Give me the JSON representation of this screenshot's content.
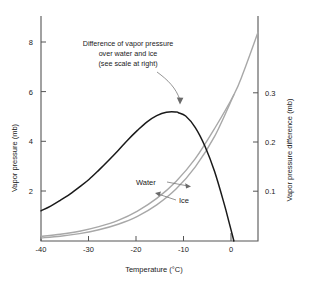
{
  "chart_data": {
    "type": "line",
    "title": "",
    "xlabel": "Temperature (°C)",
    "ylabel": "Vapor pressure (mb)",
    "y2label": "Vapor pressure difference (mb)",
    "xlim": [
      -40,
      5
    ],
    "ylim": [
      0,
      9.4
    ],
    "y2lim": [
      0,
      0.47
    ],
    "grid": false,
    "legend_position": "inline-annotations",
    "x_ticks": [
      -40,
      -30,
      -20,
      -10,
      0
    ],
    "x_tick_labels": [
      "-40",
      "-30",
      "-20",
      "-10",
      "0"
    ],
    "y_ticks": [
      2,
      4,
      6,
      8
    ],
    "y_tick_labels": [
      "2",
      "4",
      "6",
      "8"
    ],
    "y2_ticks": [
      0.1,
      0.2,
      0.3
    ],
    "y2_tick_labels": [
      "0.1",
      "0.2",
      "0.3"
    ],
    "annotations": [
      {
        "name": "difference-annotation",
        "lines": [
          "Difference of vapor pressure",
          "over water and ice",
          "(see scale at right)"
        ],
        "points_to": {
          "x": -11.5,
          "y2": 0.268
        }
      }
    ],
    "series": [
      {
        "name": "Difference of vapor pressure over water and ice",
        "short_name": "Difference",
        "axis": "right",
        "color": "#1a1a1a",
        "x": [
          -40,
          -38,
          -36,
          -34,
          -32,
          -30,
          -28,
          -26,
          -24,
          -22,
          -20,
          -18,
          -16,
          -14,
          -12,
          -11.5,
          -10,
          -8,
          -6,
          -4,
          -2,
          -1,
          0
        ],
        "values": [
          0.063,
          0.073,
          0.085,
          0.098,
          0.113,
          0.129,
          0.148,
          0.168,
          0.189,
          0.211,
          0.231,
          0.249,
          0.262,
          0.269,
          0.2695,
          0.268,
          0.261,
          0.237,
          0.198,
          0.145,
          0.077,
          0.039,
          0.0
        ]
      },
      {
        "name": "Water",
        "short_name": "Water",
        "axis": "left",
        "color": "#a8a8a8",
        "x": [
          -40,
          -36,
          -32,
          -28,
          -24,
          -20,
          -16,
          -12,
          -8,
          -4,
          0,
          2,
          5
        ],
        "values": [
          0.19,
          0.28,
          0.41,
          0.6,
          0.86,
          1.25,
          1.78,
          2.49,
          3.44,
          4.7,
          6.11,
          7.06,
          8.72
        ]
      },
      {
        "name": "Ice",
        "short_name": "Ice",
        "axis": "left",
        "color": "#a8a8a8",
        "x": [
          -40,
          -36,
          -32,
          -28,
          -24,
          -20,
          -16,
          -12,
          -8,
          -4,
          0
        ],
        "values": [
          0.128,
          0.2,
          0.31,
          0.47,
          0.7,
          1.03,
          1.51,
          2.17,
          3.1,
          4.37,
          6.11
        ]
      }
    ],
    "series_labels": [
      {
        "name": "water-label",
        "text": "Water"
      },
      {
        "name": "ice-label",
        "text": "Ice"
      }
    ]
  },
  "figure": {
    "axis_titles": {
      "x": "Temperature (°C)",
      "y_left": "Vapor pressure (mb)",
      "y_right": "Vapor pressure difference (mb)"
    },
    "annotation": {
      "line1": "Difference of vapor pressure",
      "line2": "over water and ice",
      "line3": "(see scale at right)"
    },
    "labels": {
      "water": "Water",
      "ice": "Ice"
    },
    "x_ticks": [
      "-40",
      "-30",
      "-20",
      "-10",
      "0"
    ],
    "y_ticks": [
      "8",
      "6",
      "4",
      "2"
    ],
    "y2_ticks": [
      "0.3",
      "0.2",
      "0.1"
    ],
    "colors": {
      "curve_difference": "#1a1a1a",
      "curve_saturation": "#a8a8a8",
      "axis": "#555555",
      "text": "#1a1a1a",
      "background": "#ffffff"
    }
  }
}
